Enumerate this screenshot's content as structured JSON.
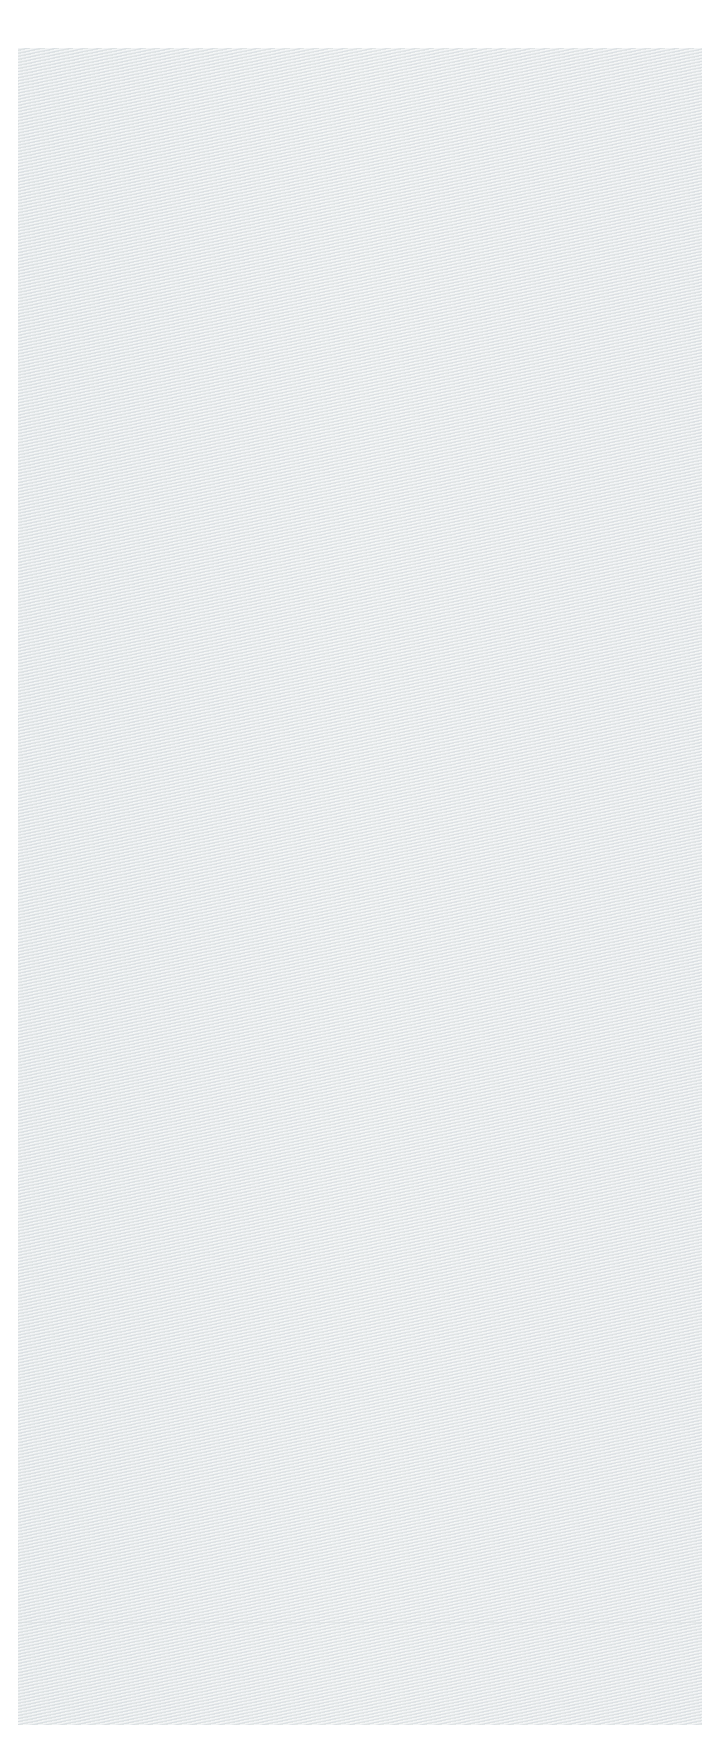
{
  "image": {
    "description": "Scanned light gray textured fabric swatch with moiré wave pattern",
    "background_color": "#ffffff",
    "swatch_color": "#e6e9ea"
  }
}
